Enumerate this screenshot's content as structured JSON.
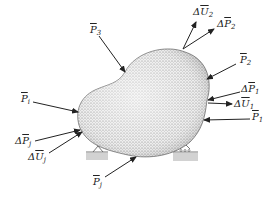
{
  "diagram": {
    "labels": {
      "dU2": {
        "delta": "Δ",
        "sym": "U",
        "sub": "2"
      },
      "dP2": {
        "delta": "Δ",
        "sym": "P",
        "sub": "2"
      },
      "P3": {
        "delta": "",
        "sym": "P",
        "sub": "3"
      },
      "P2": {
        "delta": "",
        "sym": "P",
        "sub": "2"
      },
      "dP1": {
        "delta": "Δ",
        "sym": "P",
        "sub": "1"
      },
      "dU1": {
        "delta": "Δ",
        "sym": "U",
        "sub": "1"
      },
      "P1": {
        "delta": "",
        "sym": "P",
        "sub": "1"
      },
      "Pi": {
        "delta": "",
        "sym": "P",
        "sub": "i"
      },
      "dPj": {
        "delta": "Δ",
        "sym": "P",
        "sub": "j"
      },
      "dUj": {
        "delta": "Δ",
        "sym": "U",
        "sub": "j"
      },
      "Pj": {
        "delta": "",
        "sym": "P",
        "sub": "j"
      }
    },
    "supports": [
      "pin-support-left",
      "roller-support-right"
    ],
    "colors": {
      "body_fill": "#e6e6e6",
      "stipple": "#555555",
      "arrow": "#222222",
      "ground": "#cfcfcf"
    }
  }
}
